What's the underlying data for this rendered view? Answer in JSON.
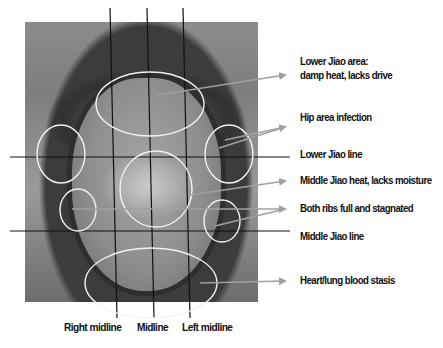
{
  "diagram": {
    "annotations": [
      {
        "id": "lower-jiao-area",
        "line1": "Lower Jiao area:",
        "line2": "damp heat, lacks drive"
      },
      {
        "id": "hip-area",
        "text": "Hip area infection"
      },
      {
        "id": "lower-jiao-line",
        "text": "Lower Jiao line"
      },
      {
        "id": "middle-jiao-heat",
        "text": "Middle Jiao heat, lacks moisture"
      },
      {
        "id": "both-ribs",
        "text": "Both ribs full and stagnated"
      },
      {
        "id": "middle-jiao-line",
        "text": "Middle Jiao line"
      },
      {
        "id": "heart-lung",
        "text": "Heart/lung blood stasis"
      }
    ],
    "bottom_labels": {
      "right_midline": "Right midline",
      "midline": "Midline",
      "left_midline": "Left midline"
    },
    "colors": {
      "ellipse_stroke": "#f2f2f2",
      "arrow": "#a0a0a0",
      "guide_line": "#111111",
      "text": "#111111"
    }
  }
}
